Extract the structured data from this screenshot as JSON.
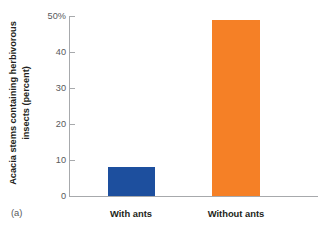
{
  "panel": {
    "label": "(a)"
  },
  "chart_data": {
    "type": "bar",
    "title": "",
    "subtitle": "",
    "xlabel": "",
    "ylabel": "Acacia stems containing herbivorous insects (percent)",
    "ylabel_line1": "Acacia stems containing herbivorous",
    "ylabel_line2": "insects (percent)",
    "categories": [
      "With ants",
      "Without ants"
    ],
    "values": [
      8,
      49
    ],
    "ylim": [
      0,
      50
    ],
    "yticks": [
      0,
      10,
      20,
      30,
      40,
      50
    ],
    "ytick_labels": [
      "0",
      "10",
      "20",
      "30",
      "40",
      "50%"
    ],
    "grid": false,
    "legend": "none",
    "bar_colors": [
      "#1d4f9e",
      "#f58026"
    ],
    "axis_color": "#a7a9ac",
    "text_color": "#231f20",
    "tick_text_color": "#58595b",
    "background": "#ffffff"
  }
}
